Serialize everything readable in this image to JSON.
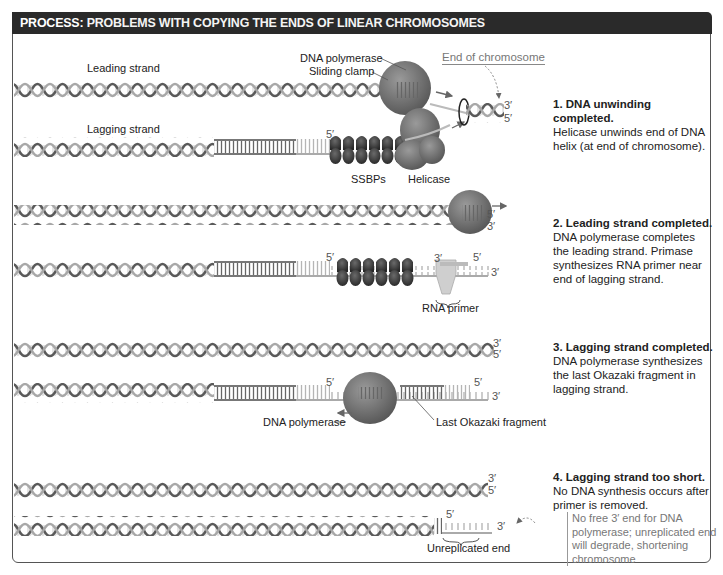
{
  "header": {
    "keyword": "PROCESS:",
    "title": "PROBLEMS WITH COPYING THE ENDS OF LINEAR CHROMOSOMES"
  },
  "colors": {
    "header_bg": "#2a2a2a",
    "header_text": "#ffffff",
    "dna_dark": "#555555",
    "dna_light": "#bdbdbd",
    "protein": "#6e6e6e",
    "ssbp": "#3d3d3d",
    "primer": "#cfcfcf",
    "muted_text": "#777777"
  },
  "panel1": {
    "labels": {
      "leading_strand": "Leading strand",
      "lagging_strand": "Lagging strand",
      "dna_polymerase": "DNA polymerase",
      "sliding_clamp": "Sliding clamp",
      "end_of_chromosome": "End of chromosome",
      "ssbps": "SSBPs",
      "helicase": "Helicase"
    },
    "primes": {
      "top_3": "3′",
      "top_5": "5′",
      "lag_5": "5′"
    },
    "step": {
      "title": "1. DNA unwinding completed.",
      "body": "Helicase unwinds end of DNA helix (at end of chromosome)."
    }
  },
  "panel2": {
    "labels": {
      "rna_primer": "RNA primer"
    },
    "primes": {
      "lead_5": "5′",
      "lead_3": "3′",
      "lag_5a": "5′",
      "primer_3": "3′",
      "primer_5": "5′",
      "lag_3": "3′"
    },
    "step": {
      "title": "2. Leading strand completed.",
      "body": "DNA polymerase completes the leading strand. Primase synthesizes RNA primer near end of lagging strand."
    }
  },
  "panel3": {
    "labels": {
      "dna_polymerase": "DNA polymerase",
      "last_okazaki": "Last Okazaki fragment"
    },
    "primes": {
      "top_3": "3′",
      "top_5": "5′",
      "lag_5a": "5′",
      "lag_5b": "5′",
      "lag_3": "3′"
    },
    "step": {
      "title": "3. Lagging strand completed.",
      "body": "DNA polymerase synthesizes the last Okazaki fragment in lagging strand."
    }
  },
  "panel4": {
    "labels": {
      "unreplicated_end": "Unreplicated end"
    },
    "primes": {
      "top_3": "3′",
      "top_5": "5′",
      "lag_5": "5′",
      "lag_3": "3′"
    },
    "step": {
      "title": "4. Lagging strand too short.",
      "body": "No DNA synthesis occurs after primer is removed."
    },
    "note": "No free 3′ end for DNA polymerase; unreplicated end will degrade, shortening chromosome"
  }
}
